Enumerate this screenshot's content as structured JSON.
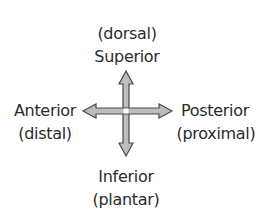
{
  "diagram": {
    "type": "anatomical-direction-compass",
    "top": {
      "secondary": "(dorsal)",
      "primary": "Superior"
    },
    "left": {
      "primary": "Anterior",
      "secondary": "(distal)"
    },
    "right": {
      "primary": "Posterior",
      "secondary": "(proximal)"
    },
    "bottom": {
      "primary": "Inferior",
      "secondary": "(plantar)"
    },
    "colors": {
      "text": "#2b2b2b",
      "arrow_fill": "#bdbdbd",
      "arrow_stroke": "#4a4a4a"
    }
  }
}
